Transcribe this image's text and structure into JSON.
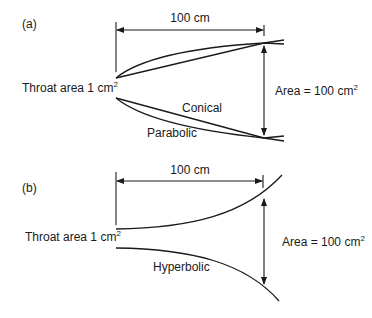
{
  "figure": {
    "panels": [
      {
        "id": "a",
        "label": "(a)",
        "length_label": "100 cm",
        "throat_label": "Throat area 1 cm",
        "throat_sup": "2",
        "mouth_label": "Area = 100 cm",
        "mouth_sup": "2",
        "curves": [
          "Conical",
          "Parabolic"
        ]
      },
      {
        "id": "b",
        "label": "(b)",
        "length_label": "100 cm",
        "throat_label": "Throat area 1 cm",
        "throat_sup": "2",
        "mouth_label": "Area = 100 cm",
        "mouth_sup": "2",
        "curves": [
          "Hyperbolic"
        ]
      }
    ],
    "colors": {
      "ink": "#1a1a1a",
      "background": "#ffffff"
    }
  }
}
